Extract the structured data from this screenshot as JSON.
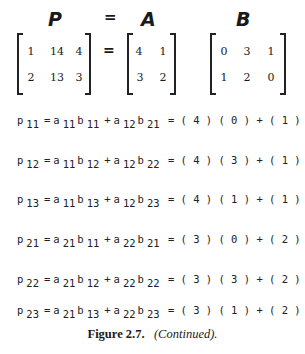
{
  "header": {
    "labels": {
      "p": "P",
      "eq": "=",
      "a": "A",
      "b": "B"
    }
  },
  "matrices": {
    "P": {
      "rows": [
        [
          "1",
          "14",
          "4"
        ],
        [
          "2",
          "13",
          "3"
        ]
      ]
    },
    "equals": "=",
    "A": {
      "rows": [
        [
          "4",
          "1"
        ],
        [
          "3",
          "2"
        ]
      ]
    },
    "B": {
      "rows": [
        [
          "0",
          "3",
          "1"
        ],
        [
          "1",
          "2",
          "0"
        ]
      ]
    }
  },
  "equations": [
    {
      "lhs": "p",
      "lhs_sub": "11",
      "t1a": "a",
      "t1a_sub": "11",
      "t1b": "b",
      "t1b_sub": "11",
      "t2a": "a",
      "t2a_sub": "12",
      "t2b": "b",
      "t2b_sub": "21",
      "expansion": "= ( 4 ) ( 0 ) + ( 1 ) ( 1 ) = 1"
    },
    {
      "lhs": "p",
      "lhs_sub": "12",
      "t1a": "a",
      "t1a_sub": "11",
      "t1b": "b",
      "t1b_sub": "12",
      "t2a": "a",
      "t2a_sub": "12",
      "t2b": "b",
      "t2b_sub": "22",
      "expansion": "= ( 4 ) ( 3 ) + ( 1 ) ( 2 ) = 14"
    },
    {
      "lhs": "p",
      "lhs_sub": "13",
      "t1a": "a",
      "t1a_sub": "11",
      "t1b": "b",
      "t1b_sub": "13",
      "t2a": "a",
      "t2a_sub": "12",
      "t2b": "b",
      "t2b_sub": "23",
      "expansion": "= ( 4 ) ( 1 ) + ( 1 ) ( 0 ) = 4"
    },
    {
      "lhs": "p",
      "lhs_sub": "21",
      "t1a": "a",
      "t1a_sub": "21",
      "t1b": "b",
      "t1b_sub": "11",
      "t2a": "a",
      "t2a_sub": "22",
      "t2b": "b",
      "t2b_sub": "21",
      "expansion": "= ( 3 ) ( 0 ) + ( 2 ) ( 1 ) = 2"
    },
    {
      "lhs": "p",
      "lhs_sub": "22",
      "t1a": "a",
      "t1a_sub": "21",
      "t1b": "b",
      "t1b_sub": "12",
      "t2a": "a",
      "t2a_sub": "22",
      "t2b": "b",
      "t2b_sub": "22",
      "expansion": "= ( 3 ) ( 3 ) + ( 2 ) ( 2 ) = 13"
    },
    {
      "lhs": "p",
      "lhs_sub": "23",
      "t1a": "a",
      "t1a_sub": "21",
      "t1b": "b",
      "t1b_sub": "13",
      "t2a": "a",
      "t2a_sub": "22",
      "t2b": "b",
      "t2b_sub": "23",
      "expansion": "= ( 3 ) ( 1 ) + ( 2 ) ( 0 ) = 3"
    }
  ],
  "symbols": {
    "equals": "=",
    "plus": "+"
  },
  "caption": {
    "label": "Figure 2.7.",
    "note": "(Continued)."
  }
}
